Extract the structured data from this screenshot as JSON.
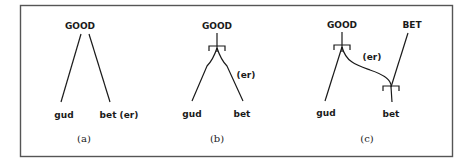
{
  "figure": {
    "panels": [
      {
        "id": "a",
        "caption": "(a)",
        "root": "GOOD",
        "left_leaf": "gud",
        "right_leaf": "bet (er)"
      },
      {
        "id": "b",
        "caption": "(b)",
        "root": "GOOD",
        "left_leaf": "gud",
        "right_leaf": "bet",
        "suffix": "(er)"
      },
      {
        "id": "c",
        "caption": "(c)",
        "root": "GOOD",
        "second_root": "BET",
        "left_leaf": "gud",
        "right_leaf": "bet",
        "suffix": "(er)"
      }
    ],
    "colors": {
      "ink": "#1a1a1a",
      "frame": "#555555",
      "background": "#ffffff"
    }
  }
}
